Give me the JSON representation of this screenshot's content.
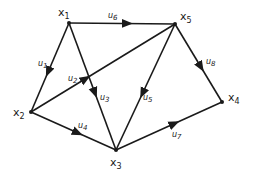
{
  "diagram": {
    "type": "directed-graph",
    "nodes": [
      {
        "id": "x1",
        "label": "x",
        "sub": "1",
        "x": 69,
        "y": 23,
        "lx": 58,
        "ly": 16
      },
      {
        "id": "x5",
        "label": "x",
        "sub": "5",
        "x": 175,
        "y": 24,
        "lx": 180,
        "ly": 20
      },
      {
        "id": "x4",
        "label": "x",
        "sub": "4",
        "x": 222,
        "y": 102,
        "lx": 228,
        "ly": 101
      },
      {
        "id": "x2",
        "label": "x",
        "sub": "2",
        "x": 31,
        "y": 112,
        "lx": 13,
        "ly": 116
      },
      {
        "id": "x3",
        "label": "x",
        "sub": "3",
        "x": 116,
        "y": 150,
        "lx": 110,
        "ly": 166
      }
    ],
    "edges": [
      {
        "id": "u1",
        "label": "u",
        "sub": "1",
        "from": "x1",
        "to": "x2",
        "lx": 38,
        "ly": 66
      },
      {
        "id": "u2",
        "label": "u",
        "sub": "2",
        "from": "x2",
        "to": "x5",
        "lx": 68,
        "ly": 81
      },
      {
        "id": "u3",
        "label": "u",
        "sub": "3",
        "from": "x1",
        "to": "x3",
        "lx": 100,
        "ly": 100
      },
      {
        "id": "u4",
        "label": "u",
        "sub": "4",
        "from": "x2",
        "to": "x3",
        "lx": 78,
        "ly": 128
      },
      {
        "id": "u5",
        "label": "u",
        "sub": "5",
        "from": "x5",
        "to": "x3",
        "lx": 143,
        "ly": 100
      },
      {
        "id": "u6",
        "label": "u",
        "sub": "6",
        "from": "x1",
        "to": "x5",
        "lx": 108,
        "ly": 18
      },
      {
        "id": "u7",
        "label": "u",
        "sub": "7",
        "from": "x3",
        "to": "x4",
        "lx": 172,
        "ly": 137
      },
      {
        "id": "u8",
        "label": "u",
        "sub": "8",
        "from": "x5",
        "to": "x4",
        "lx": 206,
        "ly": 64
      }
    ],
    "colors": {
      "stroke": "#1a1a1a",
      "background": "#ffffff"
    }
  }
}
